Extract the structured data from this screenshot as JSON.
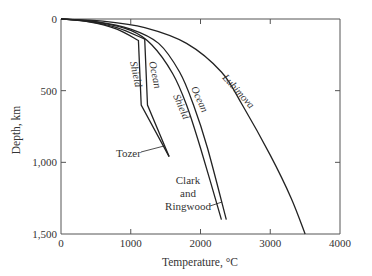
{
  "chart_data": {
    "type": "line",
    "title": "",
    "xlabel": "Temperature, °C",
    "ylabel": "Depth, km",
    "xlim": [
      0,
      4000
    ],
    "ylim": [
      1500,
      0
    ],
    "y_inverted": true,
    "grid": false,
    "legend": "inline labels",
    "x_ticks": [
      0,
      1000,
      2000,
      3000,
      4000
    ],
    "x_tick_labels": [
      "0",
      "1000",
      "2000",
      "3000",
      "4000"
    ],
    "y_ticks": [
      0,
      500,
      1000,
      1500
    ],
    "y_tick_labels": [
      "0",
      "500",
      "1,000",
      "1,500"
    ],
    "series": [
      {
        "name": "Tozer Shield",
        "points": [
          [
            0,
            0
          ],
          [
            400,
            20
          ],
          [
            800,
            70
          ],
          [
            1110,
            150
          ],
          [
            1150,
            600
          ],
          [
            1550,
            960
          ]
        ]
      },
      {
        "name": "Tozer Ocean",
        "points": [
          [
            0,
            0
          ],
          [
            400,
            18
          ],
          [
            800,
            60
          ],
          [
            1200,
            140
          ],
          [
            1240,
            600
          ],
          [
            1550,
            960
          ]
        ]
      },
      {
        "name": "Clark and Ringwood Shield",
        "points": [
          [
            0,
            0
          ],
          [
            500,
            20
          ],
          [
            1000,
            80
          ],
          [
            1300,
            180
          ],
          [
            1600,
            380
          ],
          [
            1800,
            600
          ],
          [
            2000,
            900
          ],
          [
            2300,
            1400
          ]
        ]
      },
      {
        "name": "Clark and Ringwood Ocean",
        "points": [
          [
            0,
            0
          ],
          [
            500,
            18
          ],
          [
            1000,
            70
          ],
          [
            1400,
            170
          ],
          [
            1700,
            370
          ],
          [
            1900,
            600
          ],
          [
            2100,
            900
          ],
          [
            2370,
            1400
          ]
        ]
      },
      {
        "name": "Lubimova",
        "points": [
          [
            0,
            0
          ],
          [
            600,
            15
          ],
          [
            1200,
            60
          ],
          [
            1800,
            170
          ],
          [
            2300,
            370
          ],
          [
            2600,
            600
          ],
          [
            3000,
            950
          ],
          [
            3300,
            1250
          ],
          [
            3500,
            1500
          ]
        ]
      }
    ],
    "annotations": [
      {
        "text": "Tozer",
        "points_to": "Tozer curves lower end"
      },
      {
        "text": "Clark and Ringwood",
        "points_to": "Clark and Ringwood curves lower end"
      },
      {
        "text": "Shield",
        "on": "Tozer Shield"
      },
      {
        "text": "Ocean",
        "on": "Tozer Ocean"
      },
      {
        "text": "Shield",
        "on": "Clark and Ringwood Shield"
      },
      {
        "text": "Ocean",
        "on": "Clark and Ringwood Ocean"
      },
      {
        "text": "Lubimova",
        "on": "Lubimova"
      }
    ]
  },
  "labels": {
    "xlabel": "Temperature, °C",
    "ylabel": "Depth, km",
    "tozer": "Tozer",
    "clark1": "Clark",
    "clark2": "and",
    "clark3": "Ringwood",
    "shield": "Shield",
    "ocean": "Ocean",
    "lubimova": "Lubimova"
  }
}
